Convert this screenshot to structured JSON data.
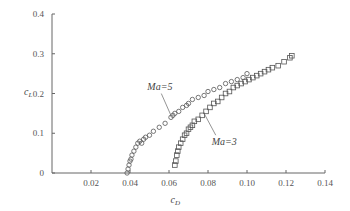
{
  "chart_data": {
    "type": "scatter",
    "title": "",
    "xlabel": "c_D",
    "ylabel": "c_L",
    "xlim": [
      0,
      0.14
    ],
    "ylim": [
      0,
      0.4
    ],
    "xticks": [
      "0.02",
      "0.04",
      "0.06",
      "0.08",
      "0.10",
      "0.12",
      "0.14"
    ],
    "yticks": [
      "0",
      "0.1",
      "0.2",
      "0.3",
      "0.4"
    ],
    "grid": false,
    "series": [
      {
        "name": "Ma=5",
        "marker": "circle",
        "x": [
          0.0385,
          0.039,
          0.0395,
          0.04,
          0.0405,
          0.041,
          0.042,
          0.043,
          0.044,
          0.045,
          0.046,
          0.047,
          0.048,
          0.05,
          0.052,
          0.055,
          0.058,
          0.061,
          0.062,
          0.063,
          0.065,
          0.067,
          0.069,
          0.07,
          0.072,
          0.075,
          0.078,
          0.08,
          0.083,
          0.086,
          0.089,
          0.092,
          0.095,
          0.098,
          0.1
        ],
        "y": [
          0.0,
          0.01,
          0.02,
          0.03,
          0.035,
          0.045,
          0.055,
          0.065,
          0.075,
          0.08,
          0.075,
          0.085,
          0.09,
          0.095,
          0.105,
          0.115,
          0.125,
          0.14,
          0.145,
          0.15,
          0.155,
          0.165,
          0.17,
          0.175,
          0.185,
          0.19,
          0.195,
          0.205,
          0.21,
          0.215,
          0.225,
          0.23,
          0.235,
          0.24,
          0.25
        ]
      },
      {
        "name": "Ma=3",
        "marker": "square",
        "x": [
          0.063,
          0.0635,
          0.064,
          0.0645,
          0.065,
          0.066,
          0.067,
          0.068,
          0.069,
          0.07,
          0.071,
          0.072,
          0.073,
          0.075,
          0.077,
          0.079,
          0.081,
          0.083,
          0.085,
          0.087,
          0.089,
          0.091,
          0.093,
          0.095,
          0.097,
          0.099,
          0.101,
          0.103,
          0.105,
          0.107,
          0.109,
          0.111,
          0.113,
          0.116,
          0.119,
          0.122,
          0.123
        ],
        "y": [
          0.02,
          0.03,
          0.045,
          0.055,
          0.065,
          0.075,
          0.085,
          0.095,
          0.1,
          0.11,
          0.115,
          0.12,
          0.13,
          0.135,
          0.145,
          0.155,
          0.165,
          0.175,
          0.18,
          0.19,
          0.2,
          0.205,
          0.215,
          0.22,
          0.225,
          0.23,
          0.235,
          0.24,
          0.245,
          0.25,
          0.255,
          0.26,
          0.265,
          0.27,
          0.28,
          0.29,
          0.295
        ]
      }
    ],
    "annotations": [
      {
        "text": "Ma=5",
        "x": 0.054,
        "y": 0.22
      },
      {
        "text": "Ma=3",
        "x": 0.085,
        "y": 0.08
      }
    ]
  }
}
